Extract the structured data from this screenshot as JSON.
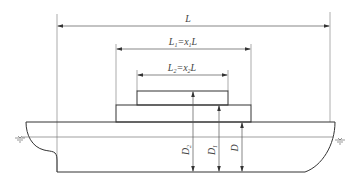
{
  "diagram": {
    "labels": {
      "overall_length": "L",
      "first_tier_length": {
        "main": "L",
        "sub": "1",
        "eq": "=x",
        "eq_sub": "1",
        "tail": "L"
      },
      "second_tier_length": {
        "main": "L",
        "sub": "2",
        "eq": "=x",
        "eq_sub": "2",
        "tail": "L"
      },
      "depth_to_second_tier": {
        "main": "D",
        "sub": "2"
      },
      "depth_to_first_tier": {
        "main": "D",
        "sub": "1"
      },
      "depth": {
        "main": "D"
      }
    },
    "symbols": {
      "waterline_left": "waterline-symbol",
      "waterline_right": "waterline-symbol"
    },
    "colors": {
      "hull_stroke": "#333333",
      "dimension_stroke": "#555555",
      "guide_stroke": "#888888",
      "text": "#444444"
    }
  }
}
